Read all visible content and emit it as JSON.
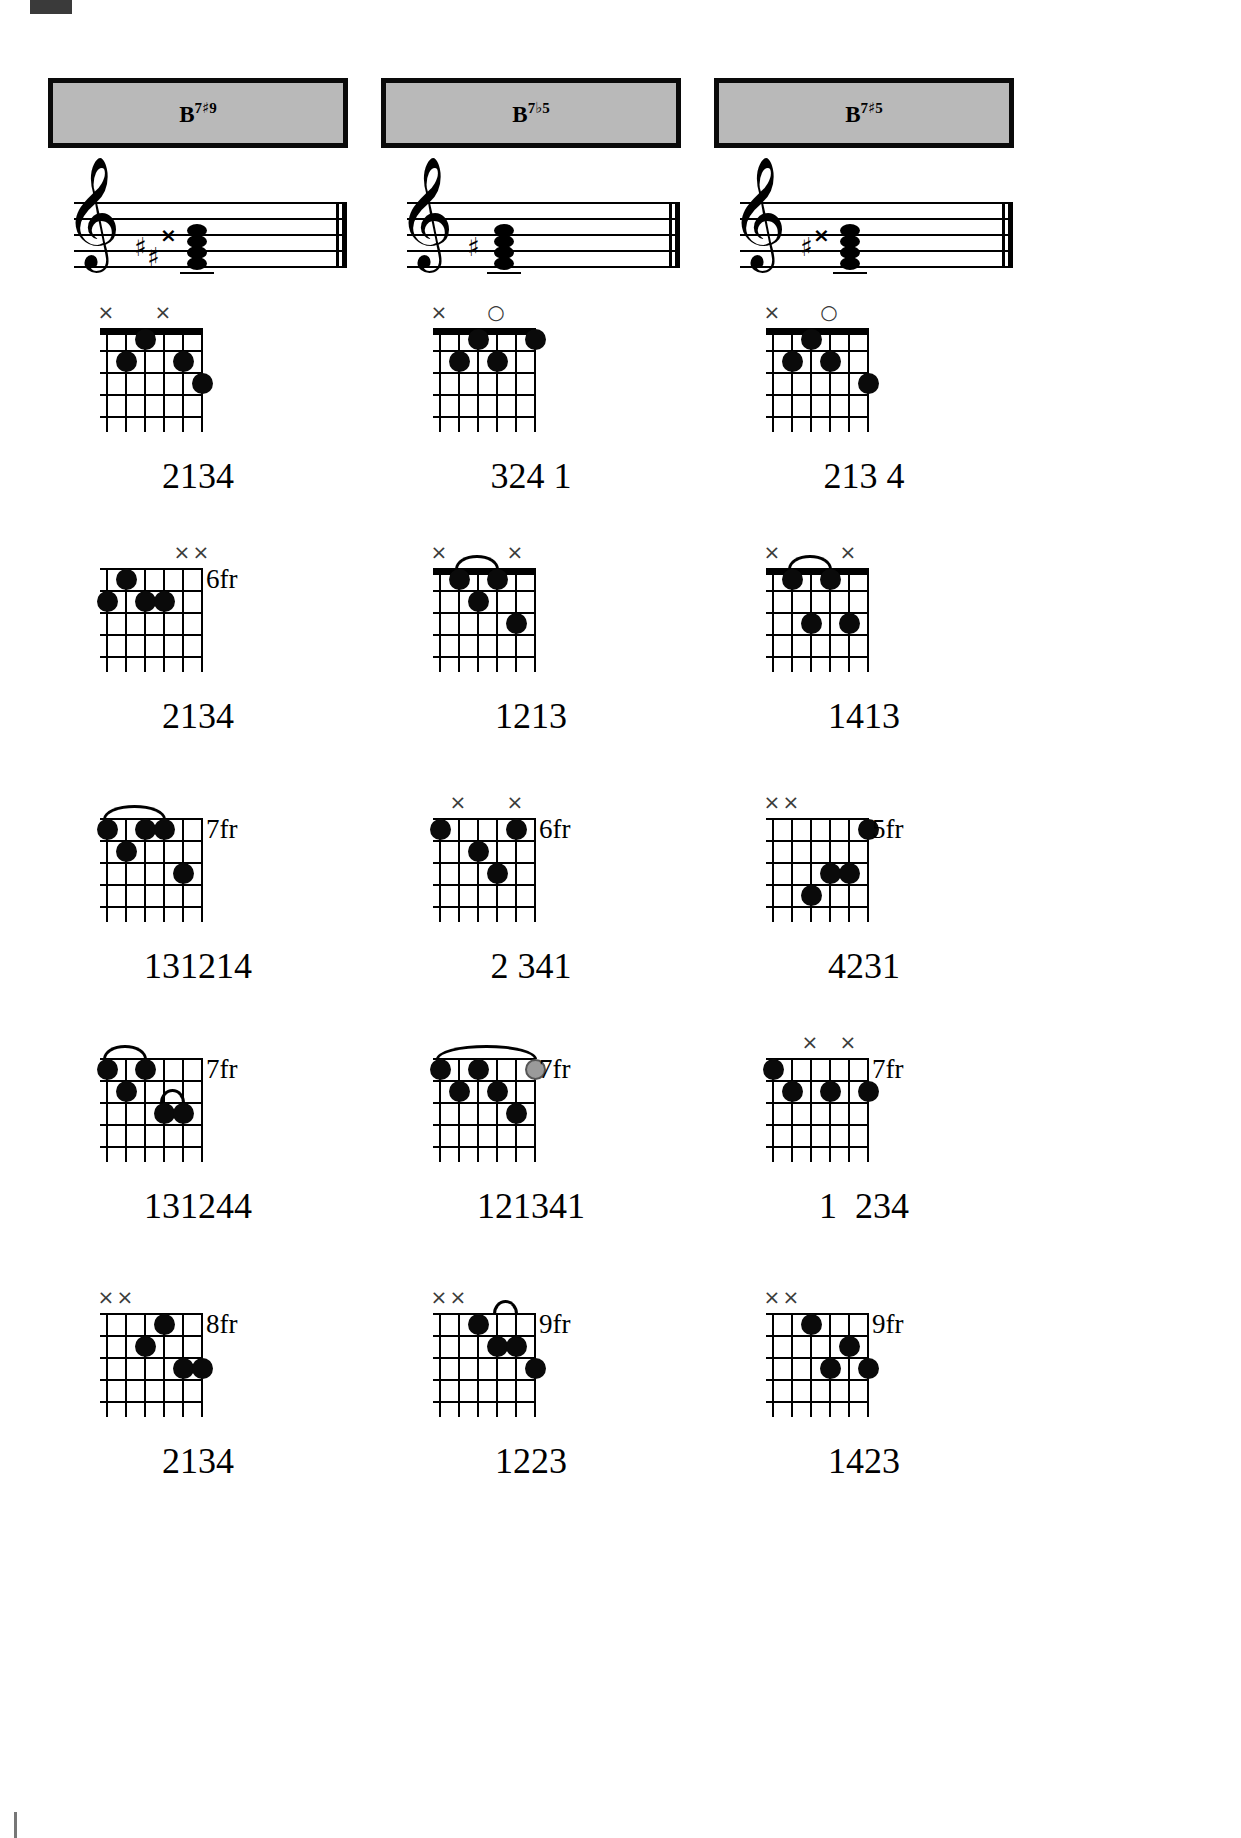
{
  "page": {
    "background_color": "#ffffff",
    "header_fill": "#b9b9b9",
    "header_border": "#0a0a0a",
    "dot_color": "#0a0a0a",
    "gray_dot_color": "#9a9a9a",
    "mark_color": "#3a3a3a"
  },
  "columns": [
    {
      "header": {
        "root": "B",
        "quality_sup": "7",
        "accidental": "#",
        "extension": "9",
        "full": "B7#9"
      },
      "staff": {
        "clef": "treble-clef",
        "accidentals": [
          "sharp",
          "sharp",
          "double-sharp"
        ],
        "noteheads": 4
      },
      "diagrams": [
        {
          "name": "b7s9-open",
          "fret_label": "",
          "markers": [
            {
              "string": 1,
              "symbol": "×"
            },
            {
              "string": 4,
              "symbol": "×"
            }
          ],
          "dots": [
            {
              "string": 3,
              "fret": 1
            },
            {
              "string": 2,
              "fret": 2
            },
            {
              "string": 5,
              "fret": 2
            },
            {
              "string": 6,
              "fret": 3
            }
          ],
          "barres": [],
          "fingering": "2134"
        },
        {
          "name": "b7s9-6fr",
          "fret_label": "6fr",
          "markers": [
            {
              "string": 5,
              "symbol": "×"
            },
            {
              "string": 6,
              "symbol": "×"
            }
          ],
          "dots": [
            {
              "string": 2,
              "fret": 1
            },
            {
              "string": 1,
              "fret": 2
            },
            {
              "string": 3,
              "fret": 2
            },
            {
              "string": 4,
              "fret": 2
            }
          ],
          "barres": [],
          "fingering": "2134"
        },
        {
          "name": "b7s9-7fr",
          "fret_label": "7fr",
          "markers": [],
          "dots": [
            {
              "string": 1,
              "fret": 1
            },
            {
              "string": 3,
              "fret": 1
            },
            {
              "string": 4,
              "fret": 1
            },
            {
              "string": 2,
              "fret": 2
            },
            {
              "string": 5,
              "fret": 3
            }
          ],
          "barres": [
            {
              "fret": 1,
              "from": 1,
              "to": 4
            }
          ],
          "fingering": "131214"
        },
        {
          "name": "b7s9-7fr-b",
          "fret_label": "7fr",
          "markers": [],
          "dots": [
            {
              "string": 1,
              "fret": 1
            },
            {
              "string": 3,
              "fret": 1
            },
            {
              "string": 2,
              "fret": 2
            },
            {
              "string": 4,
              "fret": 3
            },
            {
              "string": 5,
              "fret": 3
            }
          ],
          "barres": [
            {
              "fret": 1,
              "from": 1,
              "to": 3
            },
            {
              "fret": 3,
              "from": 4,
              "to": 5
            }
          ],
          "fingering": "131244"
        },
        {
          "name": "b7s9-8fr",
          "fret_label": "8fr",
          "markers": [
            {
              "string": 1,
              "symbol": "×"
            },
            {
              "string": 2,
              "symbol": "×"
            }
          ],
          "dots": [
            {
              "string": 4,
              "fret": 1
            },
            {
              "string": 3,
              "fret": 2
            },
            {
              "string": 5,
              "fret": 3
            },
            {
              "string": 6,
              "fret": 3
            }
          ],
          "barres": [],
          "fingering": "2134"
        }
      ]
    },
    {
      "header": {
        "root": "B",
        "quality_sup": "7",
        "accidental": "b",
        "extension": "5",
        "full": "B7b5"
      },
      "staff": {
        "clef": "treble-clef",
        "accidentals": [
          "sharp"
        ],
        "noteheads": 4
      },
      "diagrams": [
        {
          "name": "b7b5-open",
          "fret_label": "",
          "markers": [
            {
              "string": 1,
              "symbol": "×"
            },
            {
              "string": 4,
              "symbol": "○"
            }
          ],
          "dots": [
            {
              "string": 3,
              "fret": 1
            },
            {
              "string": 6,
              "fret": 1
            },
            {
              "string": 2,
              "fret": 2
            },
            {
              "string": 4,
              "fret": 2
            }
          ],
          "barres": [],
          "fingering": "324 1"
        },
        {
          "name": "b7b5-2",
          "fret_label": "",
          "markers": [
            {
              "string": 1,
              "symbol": "×"
            },
            {
              "string": 5,
              "symbol": "×"
            }
          ],
          "dots": [
            {
              "string": 2,
              "fret": 1
            },
            {
              "string": 4,
              "fret": 1
            },
            {
              "string": 3,
              "fret": 2
            },
            {
              "string": 5,
              "fret": 3
            }
          ],
          "barres": [
            {
              "fret": 1,
              "from": 2,
              "to": 4
            }
          ],
          "fingering": "1213"
        },
        {
          "name": "b7b5-6fr",
          "fret_label": "6fr",
          "markers": [
            {
              "string": 2,
              "symbol": "×"
            },
            {
              "string": 5,
              "symbol": "×"
            }
          ],
          "dots": [
            {
              "string": 1,
              "fret": 1
            },
            {
              "string": 5,
              "fret": 1
            },
            {
              "string": 3,
              "fret": 2
            },
            {
              "string": 4,
              "fret": 3
            }
          ],
          "barres": [],
          "fingering": "2 341"
        },
        {
          "name": "b7b5-7fr",
          "fret_label": "7fr",
          "markers": [],
          "dots": [
            {
              "string": 1,
              "fret": 1
            },
            {
              "string": 3,
              "fret": 1
            },
            {
              "string": 6,
              "fret": 1,
              "gray": true
            },
            {
              "string": 2,
              "fret": 2
            },
            {
              "string": 4,
              "fret": 2
            },
            {
              "string": 5,
              "fret": 3
            }
          ],
          "barres": [
            {
              "fret": 1,
              "from": 1,
              "to": 6
            }
          ],
          "fingering": "121341"
        },
        {
          "name": "b7b5-9fr",
          "fret_label": "9fr",
          "markers": [
            {
              "string": 1,
              "symbol": "×"
            },
            {
              "string": 2,
              "symbol": "×"
            }
          ],
          "dots": [
            {
              "string": 3,
              "fret": 1
            },
            {
              "string": 4,
              "fret": 2
            },
            {
              "string": 5,
              "fret": 2
            },
            {
              "string": 6,
              "fret": 3
            }
          ],
          "barres": [
            {
              "fret": 1,
              "from": 4,
              "to": 5
            }
          ],
          "fingering": "1223"
        }
      ]
    },
    {
      "header": {
        "root": "B",
        "quality_sup": "7",
        "accidental": "#",
        "extension": "5",
        "full": "B7#5"
      },
      "staff": {
        "clef": "treble-clef",
        "accidentals": [
          "sharp",
          "double-sharp"
        ],
        "noteheads": 4
      },
      "diagrams": [
        {
          "name": "b7s5-open",
          "fret_label": "",
          "markers": [
            {
              "string": 1,
              "symbol": "×"
            },
            {
              "string": 4,
              "symbol": "○"
            }
          ],
          "dots": [
            {
              "string": 3,
              "fret": 1
            },
            {
              "string": 2,
              "fret": 2
            },
            {
              "string": 4,
              "fret": 2
            },
            {
              "string": 6,
              "fret": 3
            }
          ],
          "barres": [],
          "fingering": "213 4"
        },
        {
          "name": "b7s5-2",
          "fret_label": "",
          "markers": [
            {
              "string": 1,
              "symbol": "×"
            },
            {
              "string": 5,
              "symbol": "×"
            }
          ],
          "dots": [
            {
              "string": 2,
              "fret": 1
            },
            {
              "string": 4,
              "fret": 1
            },
            {
              "string": 5,
              "fret": 3
            },
            {
              "string": 3,
              "fret": 3
            }
          ],
          "barres": [
            {
              "fret": 1,
              "from": 2,
              "to": 4
            }
          ],
          "fingering": "1413"
        },
        {
          "name": "b7s5-5fr",
          "fret_label": "5fr",
          "markers": [
            {
              "string": 1,
              "symbol": "×"
            },
            {
              "string": 2,
              "symbol": "×"
            }
          ],
          "dots": [
            {
              "string": 6,
              "fret": 1
            },
            {
              "string": 4,
              "fret": 3
            },
            {
              "string": 5,
              "fret": 3
            },
            {
              "string": 3,
              "fret": 4
            }
          ],
          "barres": [],
          "fingering": "4231"
        },
        {
          "name": "b7s5-7fr",
          "fret_label": "7fr",
          "markers": [
            {
              "string": 3,
              "symbol": "×"
            },
            {
              "string": 5,
              "symbol": "×"
            }
          ],
          "dots": [
            {
              "string": 1,
              "fret": 1
            },
            {
              "string": 2,
              "fret": 2
            },
            {
              "string": 4,
              "fret": 2
            },
            {
              "string": 6,
              "fret": 2
            }
          ],
          "barres": [],
          "fingering": "1  234"
        },
        {
          "name": "b7s5-9fr",
          "fret_label": "9fr",
          "markers": [
            {
              "string": 1,
              "symbol": "×"
            },
            {
              "string": 2,
              "symbol": "×"
            }
          ],
          "dots": [
            {
              "string": 3,
              "fret": 1
            },
            {
              "string": 5,
              "fret": 2
            },
            {
              "string": 6,
              "fret": 3
            },
            {
              "string": 4,
              "fret": 3
            }
          ],
          "barres": [],
          "fingering": "1423"
        }
      ]
    }
  ],
  "row_tops": [
    300,
    540,
    790,
    1030,
    1285
  ]
}
